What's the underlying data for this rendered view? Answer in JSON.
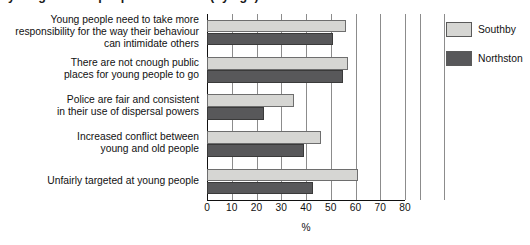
{
  "chart_data": {
    "type": "bar",
    "orientation": "horizontal",
    "title": "young and old people in the area (by age)",
    "xlabel": "%",
    "ylabel": "",
    "xlim": [
      0,
      80
    ],
    "xticks": [
      0,
      10,
      20,
      30,
      40,
      50,
      60,
      70,
      80
    ],
    "grid": true,
    "legend_position": "right",
    "categories": [
      "Young people need to take more responsibility for the way their behaviour can intimidate others",
      "There are not cnough public places for young people to go",
      "Police are fair and consistent in their use of dispersal powers",
      "Increased conflict between young and old people",
      "Unfairly targeted at young people"
    ],
    "category_lines": [
      [
        "Young people need to take more",
        "responsibility for the way their behaviour",
        "can intimidate others"
      ],
      [
        "There are not cnough public",
        "places for young people to go"
      ],
      [
        "Police are fair and consistent",
        "in their use of dispersal powers"
      ],
      [
        "Increased conflict between",
        "young and old people"
      ],
      [
        "Unfairly targeted at young people"
      ]
    ],
    "series": [
      {
        "name": "Southby",
        "color": "#d6d6d3",
        "values": [
          56,
          57,
          35,
          46,
          61
        ]
      },
      {
        "name": "Northston",
        "color": "#58585a",
        "values": [
          51,
          55,
          23,
          39,
          43
        ]
      }
    ]
  },
  "legend": {
    "items": [
      {
        "label": "Southby",
        "color": "#d6d6d3"
      },
      {
        "label": "Northston",
        "color": "#58585a"
      }
    ]
  },
  "axis": {
    "x_title": "%",
    "tick_labels": [
      "0",
      "10",
      "20",
      "30",
      "40",
      "50",
      "60",
      "70",
      "80"
    ]
  }
}
